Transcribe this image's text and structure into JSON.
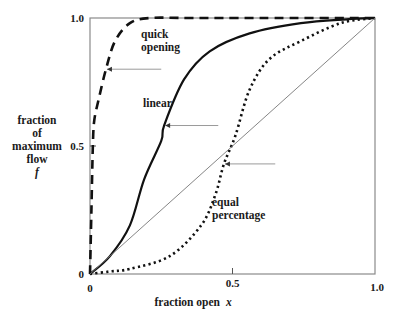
{
  "chart_data": {
    "type": "line",
    "title": "",
    "xlabel": "fraction open",
    "xlabel_var": "x",
    "ylabel_lines": [
      "fraction",
      "of",
      "maximum",
      "flow"
    ],
    "ylabel_var": "f",
    "xlim": [
      0,
      1
    ],
    "ylim": [
      0,
      1
    ],
    "grid": false,
    "legend": "none (inline annotations with arrows)",
    "x_ticks": [
      {
        "value": 0,
        "label": "0"
      },
      {
        "value": 0.5,
        "label": "0.5"
      },
      {
        "value": 1.0,
        "label": "1.0"
      }
    ],
    "y_ticks": [
      {
        "value": 0,
        "label": "0"
      },
      {
        "value": 0.5,
        "label": "0.5"
      },
      {
        "value": 1.0,
        "label": "1.0"
      }
    ],
    "series": [
      {
        "name": "quick opening",
        "style": "dashed",
        "color": "#111111",
        "x": [
          0,
          0.005,
          0.01,
          0.015,
          0.03,
          0.056,
          0.088,
          0.14,
          0.21,
          0.35,
          0.6,
          1.0
        ],
        "y": [
          0,
          0.25,
          0.5,
          0.6,
          0.68,
          0.8,
          0.91,
          0.98,
          1.0,
          1.0,
          1.0,
          1.0
        ]
      },
      {
        "name": "linear",
        "style": "solid-thick",
        "color": "#111111",
        "x": [
          0,
          0.07,
          0.14,
          0.19,
          0.25,
          0.26,
          0.33,
          0.42,
          0.56,
          0.74,
          0.9,
          1.0
        ],
        "y": [
          0,
          0.07,
          0.19,
          0.37,
          0.52,
          0.58,
          0.76,
          0.87,
          0.94,
          0.98,
          0.995,
          1.0
        ]
      },
      {
        "name": "equal percentage",
        "style": "dotted",
        "color": "#111111",
        "x": [
          0,
          0.07,
          0.14,
          0.28,
          0.39,
          0.44,
          0.47,
          0.51,
          0.56,
          0.63,
          0.74,
          0.88,
          1.0
        ],
        "y": [
          0,
          0.01,
          0.02,
          0.07,
          0.19,
          0.31,
          0.43,
          0.54,
          0.72,
          0.84,
          0.91,
          0.98,
          1.0
        ]
      },
      {
        "name": "reference diagonal",
        "style": "thin",
        "color": "#777777",
        "x": [
          0,
          1
        ],
        "y": [
          0,
          1
        ]
      }
    ],
    "annotations": [
      {
        "text_lines": [
          "quick",
          "opening"
        ],
        "label_xy": [
          0.12,
          0.86
        ],
        "arrow_from": [
          0.25,
          0.8
        ],
        "arrow_to": [
          0.056,
          0.8
        ]
      },
      {
        "text_lines": [
          "linear"
        ],
        "label_xy": [
          0.19,
          0.67
        ],
        "arrow_from": [
          0.45,
          0.58
        ],
        "arrow_to": [
          0.26,
          0.58
        ]
      },
      {
        "text_lines": [
          "equal",
          "percentage"
        ],
        "label_xy": [
          0.42,
          0.31
        ],
        "arrow_from": [
          0.65,
          0.43
        ],
        "arrow_to": [
          0.47,
          0.43
        ]
      }
    ]
  },
  "labels": {
    "y_title_1": "fraction",
    "y_title_2": "of",
    "y_title_3": "maximum",
    "y_title_4": "flow",
    "y_title_var": "f",
    "x_title": "fraction open",
    "x_title_var": "x",
    "ytick_0": "0",
    "ytick_05": "0.5",
    "ytick_1": "1.0",
    "xtick_0": "0",
    "xtick_05": "0.5",
    "xtick_1": "1.0",
    "ann_quick_1": "quick",
    "ann_quick_2": "opening",
    "ann_linear": "linear",
    "ann_equal_1": "equal",
    "ann_equal_2": "percentage"
  }
}
